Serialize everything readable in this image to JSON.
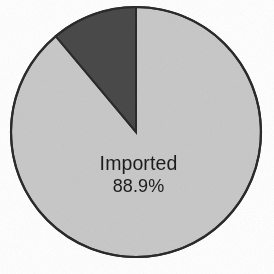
{
  "figure": {
    "background_color": "#ffffff",
    "width": 274,
    "height": 274,
    "outline_color": "#2b2b2b"
  },
  "chart_data": {
    "type": "pie",
    "title": "",
    "subtitle": "",
    "xlabel": "",
    "ylabel": "",
    "legend_position": "none",
    "grid": false,
    "start_angle_deg": 0,
    "direction": "clockwise",
    "center": {
      "x": 136,
      "y": 132
    },
    "radius": 125,
    "categories": [
      "Imported",
      ""
    ],
    "values": [
      88.9,
      11.1
    ],
    "labels": [
      "Imported\n88.9%",
      ""
    ],
    "colors": [
      "#c9c9c9",
      "#4a4a4a"
    ],
    "slices": [
      {
        "name": "Imported",
        "percent": 88.9,
        "percent_text": "88.9%",
        "label": "Imported",
        "color": "#c9c9c9",
        "labelled": true,
        "start_angle_deg": 0,
        "end_angle_deg": 320.04
      },
      {
        "name": "",
        "percent": 11.1,
        "percent_text": "11.1%",
        "label": "",
        "color": "#4a4a4a",
        "labelled": false,
        "start_angle_deg": 320.04,
        "end_angle_deg": 360
      }
    ]
  },
  "labels": {
    "imported_name": "Imported",
    "imported_value": "88.9%"
  }
}
